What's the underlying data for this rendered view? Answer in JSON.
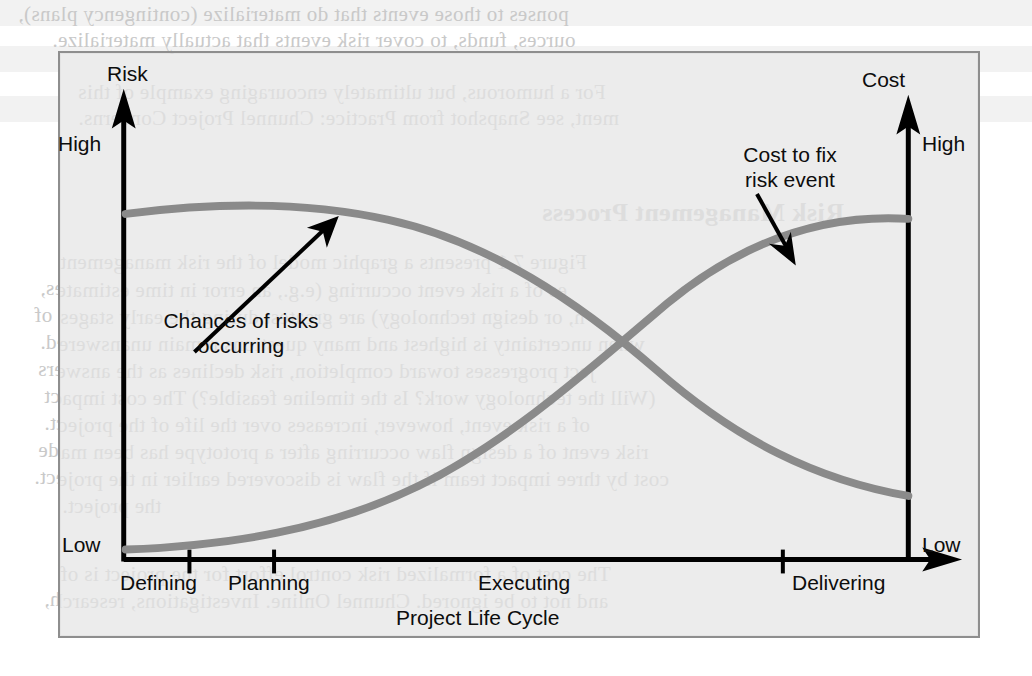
{
  "page": {
    "background_color": "#ffffff",
    "figure_bg_color": "#ececec",
    "figure_border_color": "#8e8e8e",
    "axis_color": "#000000",
    "curve_color": "#8a8a8a",
    "text_color": "#0d0d0d"
  },
  "bleed_text": {
    "note": "mirrored show-through text from the reverse side of the scanned book page",
    "lines": [
      {
        "text": "ponses to those events that do materialize (contingency plans),",
        "x": 18,
        "y": 2
      },
      {
        "text": "ources, funds, to cover risk events that actually materialize.",
        "x": 52,
        "y": 28
      },
      {
        "text": "For a humorous, but ultimately encouraging example of this",
        "x": 76,
        "y": 78
      },
      {
        "text": "ment, see Snapshot from Practice: Chunnel Project Concerns.",
        "x": 76,
        "y": 104
      },
      {
        "text": "Risk Management Process",
        "x": 540,
        "y": 196,
        "big": true
      },
      {
        "text": "Figure 7.1 presents a graphic model of the risk management",
        "x": 58,
        "y": 248
      },
      {
        "text": "es of a risk event occurring (e.g., an error in time estimates,",
        "x": 40,
        "y": 276
      },
      {
        "text": "n, or design technology) are greatest during the early stages of",
        "x": 34,
        "y": 303
      },
      {
        "text": "when uncertainty is highest and many questions remain unanswered.",
        "x": 40,
        "y": 330
      },
      {
        "text": "ject progresses toward completion, risk declines as the answers",
        "x": 38,
        "y": 357
      },
      {
        "text": "(Will the technology work? Is the timeline feasible?) The cost impact",
        "x": 44,
        "y": 384
      },
      {
        "text": "of a risk event, however, increases over the life of the project.",
        "x": 44,
        "y": 411
      },
      {
        "text": "risk event of a design flaw occurring after a prototype has been made",
        "x": 38,
        "y": 438
      },
      {
        "text": "cost by three impact team if the flaw is discovered earlier in the project.",
        "x": 34,
        "y": 465
      },
      {
        "text": "the project.",
        "x": 60,
        "y": 492
      },
      {
        "text": "The cost of a formalized risk control effort for the project is of",
        "x": 58,
        "y": 560
      },
      {
        "text": "and not to be ignored. Chunnel Online. Investigations, research,",
        "x": 44,
        "y": 587
      }
    ]
  },
  "chart_data": {
    "type": "line",
    "title": "",
    "xlabel": "Project Life Cycle",
    "ylabel_left": "Risk",
    "ylabel_right": "Cost",
    "y_left_ticks": [
      "High",
      "Low"
    ],
    "y_right_ticks": [
      "High",
      "Low"
    ],
    "x_phase_labels": [
      "Defining",
      "Planning",
      "Executing",
      "Delivering"
    ],
    "x_tick_positions_pct": [
      14.3,
      23.3,
      81.0
    ],
    "grid": false,
    "legend_position": "inline-annotations",
    "series": [
      {
        "name": "Chances of risks occurring",
        "axis": "left",
        "color": "#8a8a8a",
        "points": [
          {
            "x": 0,
            "y": 88
          },
          {
            "x": 12,
            "y": 90
          },
          {
            "x": 25,
            "y": 91
          },
          {
            "x": 38,
            "y": 88
          },
          {
            "x": 50,
            "y": 79
          },
          {
            "x": 62,
            "y": 66
          },
          {
            "x": 75,
            "y": 50
          },
          {
            "x": 88,
            "y": 30
          },
          {
            "x": 100,
            "y": 14
          }
        ]
      },
      {
        "name": "Cost to fix risk event",
        "axis": "right",
        "color": "#8a8a8a",
        "points": [
          {
            "x": 0,
            "y": 3
          },
          {
            "x": 12,
            "y": 4
          },
          {
            "x": 25,
            "y": 8
          },
          {
            "x": 38,
            "y": 16
          },
          {
            "x": 50,
            "y": 29
          },
          {
            "x": 62,
            "y": 46
          },
          {
            "x": 75,
            "y": 65
          },
          {
            "x": 88,
            "y": 82
          },
          {
            "x": 100,
            "y": 90
          }
        ]
      }
    ],
    "annotations": [
      {
        "id": "chances",
        "text_line1": "Chances of risks",
        "text_line2": "occurring",
        "arrow_from": {
          "x": 193,
          "y": 300
        },
        "arrow_to": {
          "x": 337,
          "y": 216
        }
      },
      {
        "id": "cost",
        "text_line1": "Cost to fix",
        "text_line2": "risk event",
        "arrow_from": {
          "x": 758,
          "y": 193
        },
        "arrow_to": {
          "x": 793,
          "y": 250
        }
      }
    ]
  },
  "labels": {
    "risk": "Risk",
    "cost": "Cost",
    "high_left": "High",
    "high_right": "High",
    "low_left": "Low",
    "low_right": "Low",
    "defining": "Defining",
    "planning": "Planning",
    "executing": "Executing",
    "delivering": "Delivering",
    "project_life_cycle": "Project Life Cycle",
    "ann_chances_1": "Chances of risks",
    "ann_chances_2": "occurring",
    "ann_cost_1": "Cost to fix",
    "ann_cost_2": "risk event"
  }
}
